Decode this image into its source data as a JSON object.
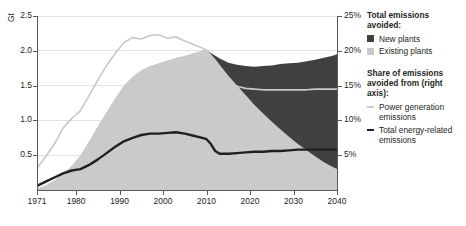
{
  "chart_data": {
    "type": "area",
    "title": "",
    "xlabel": "",
    "ylabel": "Gt",
    "y2label": "",
    "xlim": [
      1971,
      2040
    ],
    "ylim": [
      0,
      2.5
    ],
    "y2lim": [
      0,
      25
    ],
    "grid": true,
    "legend_position": "right",
    "x_ticks": [
      "1971",
      "1980",
      "1990",
      "2000",
      "2010",
      "2020",
      "2030",
      "2040"
    ],
    "x_tick_values": [
      1971,
      1980,
      1990,
      2000,
      2010,
      2020,
      2030,
      2040
    ],
    "y_ticks": [
      "0.5",
      "1.0",
      "1.5",
      "2.0",
      "2.5"
    ],
    "y_tick_values": [
      0.5,
      1.0,
      1.5,
      2.0,
      2.5
    ],
    "y2_ticks": [
      "5%",
      "10%",
      "15%",
      "20%",
      "25%"
    ],
    "y2_tick_values": [
      5,
      10,
      15,
      20,
      25
    ],
    "x": [
      1971,
      1973,
      1975,
      1977,
      1979,
      1981,
      1983,
      1985,
      1987,
      1989,
      1991,
      1993,
      1995,
      1997,
      1999,
      2001,
      2003,
      2005,
      2007,
      2009,
      2010,
      2011,
      2012,
      2013,
      2014,
      2015,
      2017,
      2019,
      2021,
      2023,
      2025,
      2027,
      2029,
      2031,
      2033,
      2035,
      2037,
      2039,
      2040
    ],
    "series": [
      {
        "name": "Existing plants",
        "axis": "left",
        "kind": "stacked-area",
        "color": "#c9cacb",
        "values": [
          0.02,
          0.07,
          0.14,
          0.24,
          0.35,
          0.5,
          0.7,
          0.92,
          1.12,
          1.32,
          1.5,
          1.63,
          1.72,
          1.78,
          1.82,
          1.86,
          1.9,
          1.93,
          1.97,
          2.0,
          2.02,
          1.95,
          1.88,
          1.8,
          1.72,
          1.64,
          1.5,
          1.36,
          1.22,
          1.1,
          0.98,
          0.87,
          0.76,
          0.66,
          0.57,
          0.48,
          0.4,
          0.33,
          0.3
        ]
      },
      {
        "name": "New plants",
        "axis": "left",
        "kind": "stacked-area",
        "color": "#404041",
        "values": [
          0.0,
          0.0,
          0.0,
          0.0,
          0.0,
          0.0,
          0.0,
          0.0,
          0.0,
          0.0,
          0.0,
          0.0,
          0.0,
          0.0,
          0.0,
          0.0,
          0.0,
          0.0,
          0.0,
          0.0,
          0.0,
          0.02,
          0.05,
          0.09,
          0.14,
          0.19,
          0.3,
          0.42,
          0.55,
          0.68,
          0.81,
          0.94,
          1.06,
          1.17,
          1.28,
          1.39,
          1.5,
          1.6,
          1.65
        ]
      },
      {
        "name": "Power generation emissions",
        "axis": "right",
        "kind": "line",
        "color": "#c9cacb",
        "values": [
          3.1,
          4.8,
          6.6,
          8.9,
          10.3,
          11.4,
          13.6,
          15.8,
          17.9,
          19.6,
          21.2,
          21.9,
          21.7,
          22.2,
          22.3,
          21.8,
          22.0,
          21.4,
          20.9,
          20.4,
          20.1,
          19.3,
          18.2,
          17.1,
          16.3,
          15.6,
          14.9,
          14.6,
          14.5,
          14.4,
          14.4,
          14.4,
          14.4,
          14.4,
          14.4,
          14.5,
          14.5,
          14.5,
          14.5
        ]
      },
      {
        "name": "Total energy-related emissions",
        "axis": "right",
        "kind": "line",
        "color": "#231f20",
        "values": [
          0.6,
          1.2,
          1.8,
          2.4,
          2.8,
          3.0,
          3.6,
          4.4,
          5.3,
          6.2,
          7.0,
          7.5,
          7.9,
          8.1,
          8.1,
          8.2,
          8.3,
          8.1,
          7.8,
          7.5,
          7.3,
          6.6,
          5.6,
          5.2,
          5.2,
          5.2,
          5.3,
          5.4,
          5.5,
          5.5,
          5.6,
          5.6,
          5.7,
          5.8,
          5.8,
          5.8,
          5.8,
          5.8,
          5.8
        ]
      }
    ]
  },
  "axes": {
    "y_unit_label": "Gt",
    "left_tick_labels": [
      "2.5",
      "2.0",
      "1.5",
      "1.0",
      "0.5"
    ],
    "right_tick_labels": [
      "25%",
      "20%",
      "15%",
      "10%",
      "5%"
    ],
    "x_tick_labels": [
      "1971",
      "1980",
      "1990",
      "2000",
      "2010",
      "2020",
      "2030",
      "2040"
    ]
  },
  "legend": {
    "group1_title": "Total emissions avoided:",
    "group1_items": [
      {
        "label": "New plants",
        "color": "#404041",
        "marker": "swatch"
      },
      {
        "label": "Existing plants",
        "color": "#c9cacb",
        "marker": "swatch"
      }
    ],
    "group2_title": "Share of emissions avoided from (right axis):",
    "group2_items": [
      {
        "label": "Power generation emissions",
        "color": "#c9cacb",
        "marker": "line"
      },
      {
        "label": "Total energy-related emissions",
        "color": "#231f20",
        "marker": "line"
      }
    ]
  },
  "colors": {
    "new_plants": "#404041",
    "existing_plants": "#c9cacb",
    "power_line": "#c9cacb",
    "total_line": "#231f20",
    "axis": "#58595b",
    "grid": "#e2e3e4",
    "text": "#231f20",
    "background": "#ffffff"
  }
}
